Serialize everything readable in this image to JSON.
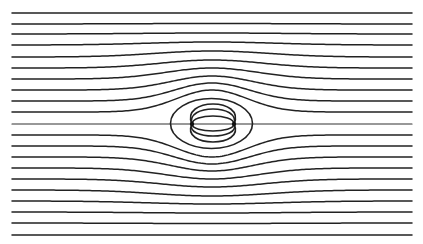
{
  "diagram": {
    "type": "streamlines-around-dipole",
    "canvas": {
      "width": 423,
      "height": 244
    },
    "stroke_color": "#222222",
    "background": "#ffffff",
    "x_start": 12,
    "x_end": 412,
    "center": {
      "x": 212,
      "y": 124
    },
    "streamlines": [
      {
        "y": 13,
        "deflection": 0,
        "width": 120
      },
      {
        "y": 24,
        "deflection": 0.5,
        "width": 110
      },
      {
        "y": 34,
        "deflection": 1,
        "width": 100
      },
      {
        "y": 45,
        "deflection": 3,
        "width": 90
      },
      {
        "y": 57,
        "deflection": 6,
        "width": 80
      },
      {
        "y": 68,
        "deflection": 8,
        "width": 72
      },
      {
        "y": 79,
        "deflection": 11,
        "width": 65
      },
      {
        "y": 90,
        "deflection": 14,
        "width": 58
      },
      {
        "y": 101,
        "deflection": 18,
        "width": 53
      },
      {
        "y": 112,
        "deflection": 22,
        "width": 50
      },
      {
        "y": 124,
        "deflection": 0,
        "width": 50
      },
      {
        "y": 135,
        "deflection": -22,
        "width": 50
      },
      {
        "y": 146,
        "deflection": -18,
        "width": 53
      },
      {
        "y": 157,
        "deflection": -14,
        "width": 58
      },
      {
        "y": 168,
        "deflection": -11,
        "width": 65
      },
      {
        "y": 179,
        "deflection": -8,
        "width": 72
      },
      {
        "y": 190,
        "deflection": -6,
        "width": 80
      },
      {
        "y": 201,
        "deflection": -3,
        "width": 90
      },
      {
        "y": 212,
        "deflection": -1,
        "width": 100
      },
      {
        "y": 223,
        "deflection": -0.5,
        "width": 110
      },
      {
        "y": 235,
        "deflection": 0,
        "width": 120
      }
    ],
    "outer_loop": {
      "cx": 211.5,
      "cy": 123.5,
      "rx": 41,
      "ry": 25
    },
    "poles": [
      {
        "name": "left-pole",
        "x": 192,
        "y": 124
      },
      {
        "name": "right-pole",
        "x": 234,
        "y": 124
      }
    ],
    "field_loops": [
      {
        "side": "upper",
        "top": 104,
        "bulge": 12
      },
      {
        "side": "upper",
        "top": 109,
        "bulge": 7
      },
      {
        "side": "upper",
        "top": 116,
        "bulge": 0
      },
      {
        "side": "lower",
        "bottom": 131,
        "bulge": 0
      },
      {
        "side": "lower",
        "bottom": 136,
        "bulge": 7
      },
      {
        "side": "lower",
        "bottom": 142,
        "bulge": 12
      }
    ]
  }
}
